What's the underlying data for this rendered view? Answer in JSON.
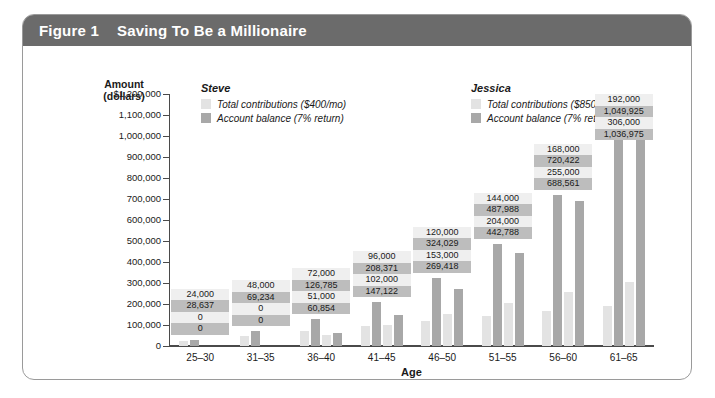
{
  "figure": {
    "number": "Figure 1",
    "title": "Saving To Be a Millionaire",
    "header_color": "#6b6b6b"
  },
  "legend": {
    "position": "top-inside",
    "groups": [
      {
        "name": "Steve",
        "entries": [
          {
            "label": "Total contributions ($400/mo)",
            "swatch": "contrib",
            "color": "#e3e3e3"
          },
          {
            "label": "Account balance (7% return)",
            "swatch": "balance",
            "color": "#a8a8a8"
          }
        ]
      },
      {
        "name": "Jessica",
        "entries": [
          {
            "label": "Total contributions ($850/mo)",
            "swatch": "contrib",
            "color": "#e3e3e3"
          },
          {
            "label": "Account balance (7% return)",
            "swatch": "balance",
            "color": "#a8a8a8"
          }
        ]
      }
    ]
  },
  "chart_data": {
    "type": "bar",
    "title": "Saving To Be a Millionaire",
    "xlabel": "Age",
    "ylabel": "Amount (dollars)",
    "ylim": [
      0,
      1200000
    ],
    "ytick_values": [
      1200000,
      1100000,
      1000000,
      900000,
      800000,
      700000,
      600000,
      500000,
      400000,
      300000,
      200000,
      100000,
      0
    ],
    "ytick_labels": [
      "$1,200,000",
      "1,100,000",
      "1,000,000",
      "900,000",
      "800,000",
      "700,000",
      "600,000",
      "500,000",
      "400,000",
      "300,000",
      "200,000",
      "100,000",
      "0"
    ],
    "grid": false,
    "categories": [
      "25–30",
      "31–35",
      "36–40",
      "41–45",
      "46–50",
      "51–55",
      "56–60",
      "61–65"
    ],
    "series": [
      {
        "name": "Steve — Total contributions ($400/mo)",
        "key": "steve_contrib",
        "style": "contrib",
        "values": [
          24000,
          48000,
          72000,
          96000,
          120000,
          144000,
          168000,
          192000
        ],
        "labels": [
          "24,000",
          "48,000",
          "72,000",
          "96,000",
          "120,000",
          "144,000",
          "168,000",
          "192,000"
        ]
      },
      {
        "name": "Steve — Account balance (7% return)",
        "key": "steve_balance",
        "style": "balance",
        "values": [
          28637,
          69234,
          126785,
          208371,
          324029,
          487988,
          720422,
          1049925
        ],
        "labels": [
          "28,637",
          "69,234",
          "126,785",
          "208,371",
          "324,029",
          "487,988",
          "720,422",
          "1,049,925"
        ]
      },
      {
        "name": "Jessica — Total contributions ($850/mo)",
        "key": "jessica_contrib",
        "style": "contrib",
        "values": [
          0,
          0,
          51000,
          102000,
          153000,
          204000,
          255000,
          306000
        ],
        "labels": [
          "0",
          "0",
          "51,000",
          "102,000",
          "153,000",
          "204,000",
          "255,000",
          "306,000"
        ]
      },
      {
        "name": "Jessica — Account balance (7% return)",
        "key": "jessica_balance",
        "style": "balance",
        "values": [
          0,
          0,
          60854,
          147122,
          269418,
          442788,
          688561,
          1036975
        ],
        "labels": [
          "0",
          "0",
          "60,854",
          "147,122",
          "269,418",
          "442,788",
          "688,561",
          "1,036,975"
        ]
      }
    ]
  }
}
